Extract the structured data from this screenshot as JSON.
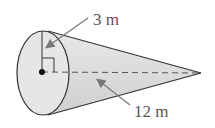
{
  "figure": {
    "type": "right circular cone",
    "radius_label": "3 m",
    "height_label": "12 m",
    "colors": {
      "outline": "#333333",
      "fill_base": "#e6e6e6",
      "fill_side": "#d9d9d9",
      "arrow": "#777777",
      "text": "#555555"
    }
  }
}
